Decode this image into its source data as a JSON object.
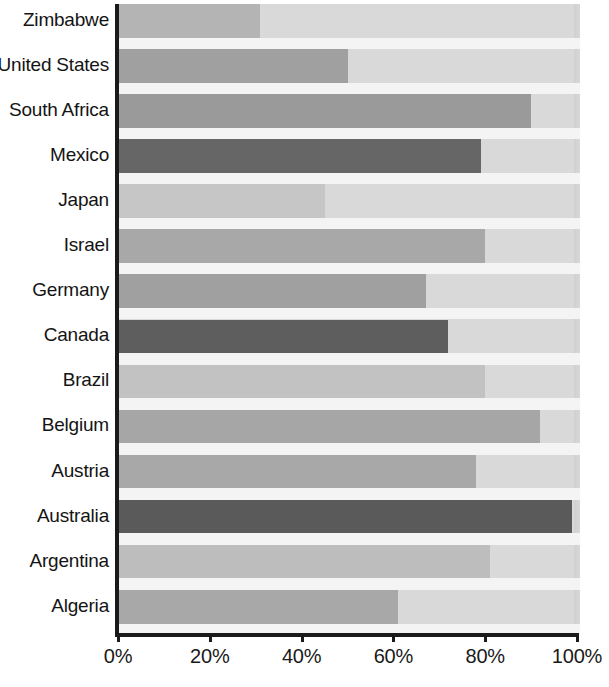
{
  "chart_data": {
    "type": "bar",
    "orientation": "horizontal",
    "title": "",
    "subtitle": "",
    "xlabel": "",
    "ylabel": "",
    "xlim": [
      0,
      100
    ],
    "xticks": [
      0,
      20,
      40,
      60,
      80,
      100
    ],
    "xtick_labels": [
      "0%",
      "20%",
      "40%",
      "60%",
      "80%",
      "100%"
    ],
    "grid": true,
    "legend": "none",
    "value_suffix": "%",
    "categories": [
      "Zimbabwe",
      "United States",
      "South Africa",
      "Mexico",
      "Japan",
      "Israel",
      "Germany",
      "Canada",
      "Brazil",
      "Belgium",
      "Austria",
      "Australia",
      "Argentina",
      "Algeria"
    ],
    "values": [
      31,
      50,
      90,
      79,
      45,
      80,
      67,
      72,
      80,
      92,
      78,
      99,
      81,
      61
    ],
    "bar_colors": [
      "#b4b4b4",
      "#a0a0a0",
      "#9a9a9a",
      "#666666",
      "#c6c6c6",
      "#a8a8a8",
      "#a0a0a0",
      "#5e5e5e",
      "#c2c2c2",
      "#a6a6a6",
      "#a8a8a8",
      "#5a5a5a",
      "#bdbdbd",
      "#a8a8a8"
    ],
    "plot_background": "#d9d9d9",
    "gridline_color": "#f4f4f4",
    "axis_color": "#1a1a1a",
    "page_background": "#ffffff"
  }
}
